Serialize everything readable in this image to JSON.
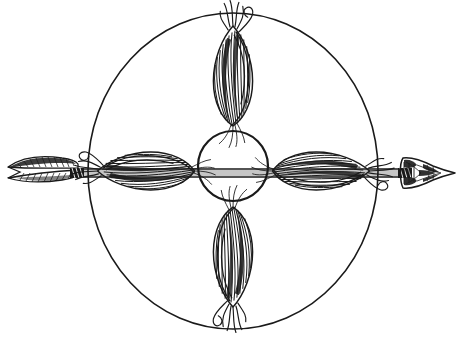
{
  "document": {
    "title": "Medicine Wheel with Four Corn Ears and Arrow",
    "kind": "pen-and-ink line drawing",
    "background_color": "#ffffff",
    "ink_color": "#1a1a1a",
    "canvas": {
      "width": 464,
      "height": 343
    }
  },
  "figure": {
    "outer_circle": {
      "label": "outer circle",
      "center_x": 233,
      "center_y": 171,
      "radius_x": 145,
      "radius_y": 158,
      "stroke_width": 1.6
    },
    "inner_circle": {
      "label": "inner circle",
      "center_x": 233,
      "center_y": 166,
      "radius": 35,
      "stroke_width": 2.2
    },
    "corn_ears": [
      {
        "position": "north",
        "label": "Corn ear - north",
        "cx": 233,
        "cy": 75,
        "rotation": 0,
        "length": 105,
        "width": 42
      },
      {
        "position": "south",
        "label": "Corn ear - south",
        "cx": 233,
        "cy": 258,
        "rotation": 180,
        "length": 105,
        "width": 42
      },
      {
        "position": "west",
        "label": "Corn ear - west",
        "cx": 145,
        "cy": 171,
        "rotation": -90,
        "length": 100,
        "width": 40
      },
      {
        "position": "east",
        "label": "Corn ear - east",
        "cx": 322,
        "cy": 171,
        "rotation": 90,
        "length": 100,
        "width": 40
      }
    ],
    "arrow": {
      "label": "arrow",
      "axis_y": 173,
      "shaft_start_x": 8,
      "shaft_end_x": 455,
      "fletching": {
        "label": "fletching",
        "start_x": 10,
        "end_x": 78,
        "height": 26
      },
      "nock_binding": {
        "label": "nock binding",
        "x": 72,
        "width": 14
      },
      "arrowhead": {
        "label": "stone arrowhead",
        "start_x": 404,
        "tip_x": 456,
        "height": 34
      },
      "haft_binding": {
        "label": "haft binding",
        "x": 404,
        "width": 16
      }
    }
  }
}
